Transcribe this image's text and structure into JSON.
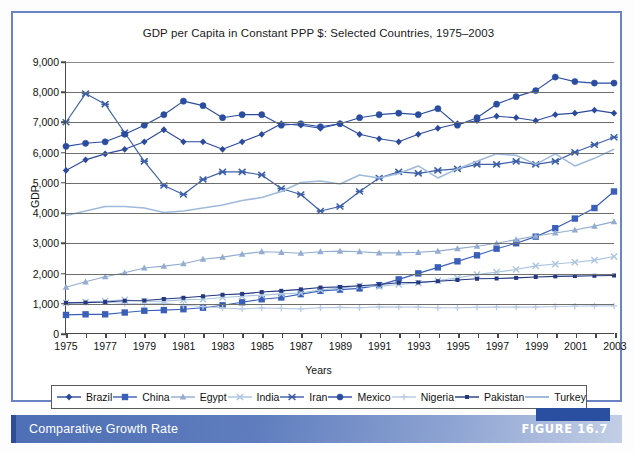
{
  "figure": {
    "caption": "Comparative Growth Rate",
    "number_label": "FIGURE 16.7"
  },
  "chart_data": {
    "type": "line",
    "title": "GDP per Capita in Constant PPP $: Selected Countries, 1975–2003",
    "xlabel": "Years",
    "ylabel": "GDP",
    "xlim": [
      1975,
      2003
    ],
    "ylim": [
      0,
      9000
    ],
    "ytick_labels": [
      "0",
      "1,000",
      "2,000",
      "3,000",
      "4,000",
      "5,000",
      "6,000",
      "7,000",
      "8,000",
      "9,000"
    ],
    "ytick_values": [
      0,
      1000,
      2000,
      3000,
      4000,
      5000,
      6000,
      7000,
      8000,
      9000
    ],
    "xtick_labels": [
      "1975",
      "1977",
      "1979",
      "1981",
      "1983",
      "1985",
      "1987",
      "1989",
      "1991",
      "1993",
      "1995",
      "1997",
      "1999",
      "2001",
      "2003"
    ],
    "xtick_values": [
      1975,
      1977,
      1979,
      1981,
      1983,
      1985,
      1987,
      1989,
      1991,
      1993,
      1995,
      1997,
      1999,
      2001,
      2003
    ],
    "grid": true,
    "legend_position": "bottom",
    "x": [
      1975,
      1976,
      1977,
      1978,
      1979,
      1980,
      1981,
      1982,
      1983,
      1984,
      1985,
      1986,
      1987,
      1988,
      1989,
      1990,
      1991,
      1992,
      1993,
      1994,
      1995,
      1996,
      1997,
      1998,
      1999,
      2000,
      2001,
      2002,
      2003
    ],
    "series": [
      {
        "name": "Brazil",
        "color": "#2c4a9c",
        "marker": "diamond",
        "values": [
          5400,
          5750,
          5950,
          6100,
          6350,
          6750,
          6350,
          6350,
          6100,
          6350,
          6600,
          6950,
          6900,
          6800,
          6950,
          6600,
          6450,
          6350,
          6600,
          6800,
          6950,
          7050,
          7200,
          7150,
          7050,
          7250,
          7300,
          7400,
          7300
        ]
      },
      {
        "name": "China",
        "color": "#3a5fb8",
        "marker": "square",
        "values": [
          600,
          620,
          620,
          680,
          740,
          760,
          790,
          840,
          920,
          1020,
          1120,
          1180,
          1290,
          1400,
          1440,
          1480,
          1590,
          1780,
          1980,
          2180,
          2380,
          2580,
          2800,
          2980,
          3200,
          3480,
          3800,
          4150,
          4700
        ]
      },
      {
        "name": "Egypt",
        "color": "#93accf",
        "marker": "triangle",
        "values": [
          1520,
          1700,
          1870,
          2000,
          2160,
          2220,
          2300,
          2450,
          2520,
          2620,
          2700,
          2680,
          2650,
          2700,
          2720,
          2700,
          2660,
          2660,
          2680,
          2720,
          2800,
          2880,
          2980,
          3100,
          3220,
          3320,
          3420,
          3550,
          3700
        ]
      },
      {
        "name": "India",
        "color": "#aac4e0",
        "marker": "x",
        "values": [
          1000,
          1030,
          1060,
          1100,
          1050,
          1060,
          1100,
          1120,
          1180,
          1220,
          1260,
          1300,
          1330,
          1430,
          1490,
          1560,
          1550,
          1610,
          1660,
          1740,
          1830,
          1940,
          2020,
          2110,
          2230,
          2290,
          2350,
          2420,
          2540
        ]
      },
      {
        "name": "Iran",
        "color": "#3c5fa8",
        "marker": "asterisk",
        "values": [
          7000,
          7950,
          7600,
          6650,
          5700,
          4900,
          4600,
          5100,
          5350,
          5350,
          5250,
          4800,
          4600,
          4050,
          4200,
          4700,
          5150,
          5350,
          5300,
          5400,
          5450,
          5600,
          5600,
          5700,
          5600,
          5700,
          6000,
          6250,
          6500
        ]
      },
      {
        "name": "Mexico",
        "color": "#2b4da0",
        "marker": "circle",
        "values": [
          6200,
          6300,
          6350,
          6600,
          6900,
          7250,
          7700,
          7550,
          7150,
          7250,
          7250,
          6900,
          6950,
          6850,
          6950,
          7150,
          7250,
          7300,
          7250,
          7450,
          6900,
          7150,
          7600,
          7850,
          8050,
          8500,
          8350,
          8300,
          8300
        ]
      },
      {
        "name": "Nigeria",
        "color": "#b9cbe3",
        "marker": "plus",
        "values": [
          1000,
          1010,
          1030,
          980,
          960,
          990,
          920,
          880,
          830,
          800,
          830,
          820,
          800,
          840,
          850,
          840,
          870,
          860,
          860,
          840,
          840,
          850,
          860,
          860,
          860,
          880,
          890,
          900,
          900
        ]
      },
      {
        "name": "Pakistan",
        "color": "#24377f",
        "marker": "small-square",
        "values": [
          1000,
          1010,
          1030,
          1070,
          1080,
          1130,
          1170,
          1220,
          1270,
          1300,
          1360,
          1400,
          1450,
          1510,
          1530,
          1570,
          1610,
          1670,
          1680,
          1720,
          1760,
          1800,
          1810,
          1830,
          1860,
          1880,
          1890,
          1900,
          1910
        ]
      },
      {
        "name": "Turkey",
        "color": "#9fbadb",
        "marker": "line",
        "values": [
          3900,
          4050,
          4200,
          4200,
          4150,
          4000,
          4050,
          4150,
          4250,
          4400,
          4500,
          4700,
          5000,
          5050,
          4950,
          5250,
          5150,
          5300,
          5550,
          5150,
          5450,
          5700,
          5950,
          5900,
          5600,
          5950,
          5550,
          5800,
          6100
        ]
      }
    ]
  }
}
